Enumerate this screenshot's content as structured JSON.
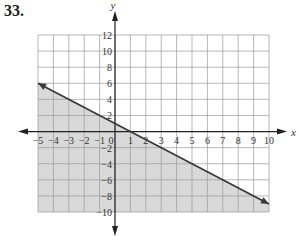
{
  "problem": {
    "number": "33."
  },
  "chart_data": {
    "type": "line",
    "title": "",
    "xlabel": "x",
    "ylabel": "y",
    "xlim": [
      -5,
      10
    ],
    "ylim": [
      -10,
      12
    ],
    "x_ticks": [
      -5,
      -4,
      -3,
      -2,
      -1,
      0,
      1,
      2,
      3,
      4,
      5,
      6,
      7,
      8,
      9,
      10
    ],
    "y_ticks": [
      -10,
      -8,
      -6,
      -4,
      -2,
      2,
      4,
      6,
      8,
      10,
      12
    ],
    "grid": true,
    "series": [
      {
        "name": "boundary line y = -x + 1",
        "x": [
          -5,
          10
        ],
        "y": [
          6,
          -9
        ],
        "style": "solid",
        "arrows": "both"
      }
    ],
    "shaded_region": {
      "description": "region below the line (y <= -x + 1)",
      "color": "#d9d9d9"
    },
    "colors": {
      "line": "#3a3a3a",
      "grid": "#9a9a9a",
      "shade": "#d9d9d9"
    }
  }
}
